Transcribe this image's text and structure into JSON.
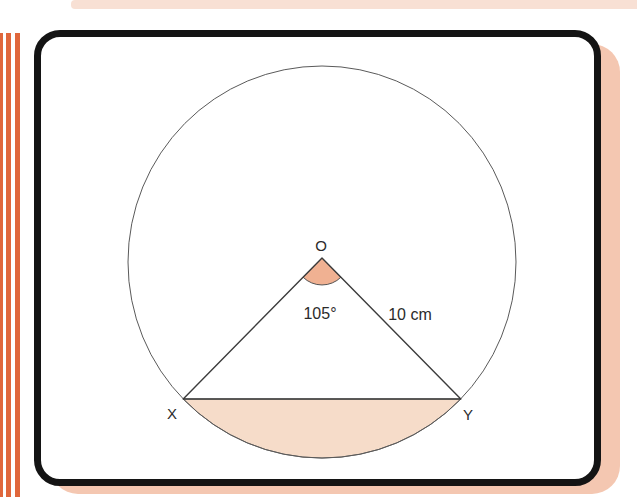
{
  "labels": {
    "center": "O",
    "angle": "105°",
    "radius": "10 cm",
    "point_left": "X",
    "point_right": "Y"
  },
  "colors": {
    "stripe_orange": "#e0673c",
    "top_band": "#f8e0d4",
    "shadow_pink": "#f4c7b1",
    "frame_black": "#141414",
    "sector_fill": "#f0b192",
    "segment_fill": "#f6dcc9"
  }
}
